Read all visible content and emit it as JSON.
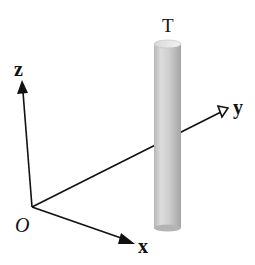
{
  "diagram": {
    "type": "3d-coordinate-axes-with-cylinder",
    "labels": {
      "origin": "O",
      "x_axis": "x",
      "y_axis": "y",
      "z_axis": "z",
      "cylinder": "T"
    },
    "colors": {
      "axis": "#111111",
      "cylinder_light": "#e6e6e6",
      "cylinder_mid": "#c4c4c4",
      "cylinder_dark": "#9a9a9a",
      "background": "#ffffff"
    }
  }
}
